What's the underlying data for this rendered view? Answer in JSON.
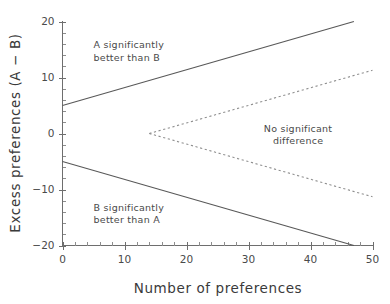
{
  "chart_data": {
    "type": "line",
    "title": "",
    "xlabel": "Number of preferences",
    "ylabel": "Excess preferences (A − B)",
    "xlim": [
      0,
      50
    ],
    "ylim": [
      -20,
      20
    ],
    "grid": false,
    "legend_position": "none",
    "x_ticks": [
      0,
      10,
      20,
      30,
      40,
      50
    ],
    "x_tick_labels": [
      "0",
      "10",
      "20",
      "30",
      "40",
      "50"
    ],
    "x_minor_tick_step": 2,
    "y_ticks": [
      20,
      10,
      0,
      -10,
      -20
    ],
    "y_tick_labels": [
      "20",
      "10",
      "0",
      "−10",
      "−20"
    ],
    "y_minor_tick_step": 2,
    "series": [
      {
        "name": "upper-significance-boundary",
        "style": "solid",
        "color": "#585858",
        "points": [
          [
            0,
            5
          ],
          [
            47,
            20
          ]
        ]
      },
      {
        "name": "lower-significance-boundary",
        "style": "solid",
        "color": "#585858",
        "points": [
          [
            0,
            -5
          ],
          [
            47,
            -20
          ]
        ]
      },
      {
        "name": "upper-dotted-boundary",
        "style": "dotted",
        "color": "#8f8f8f",
        "points": [
          [
            14,
            0
          ],
          [
            50,
            11.3
          ]
        ]
      },
      {
        "name": "lower-dotted-boundary",
        "style": "dotted",
        "color": "#8f8f8f",
        "points": [
          [
            14,
            0
          ],
          [
            50,
            -11.3
          ]
        ]
      }
    ],
    "annotations": [
      {
        "id": "region-a-better",
        "lines": [
          "A significantly",
          "better than B"
        ],
        "x": 5,
        "y": 15.2,
        "align": "left"
      },
      {
        "id": "region-no-difference",
        "lines": [
          "No significant",
          "difference"
        ],
        "x": 38,
        "y": 0.3,
        "align": "center"
      },
      {
        "id": "region-b-better",
        "lines": [
          "B significantly",
          "better than A"
        ],
        "x": 5,
        "y": -13.8,
        "align": "left"
      }
    ]
  },
  "figure": {
    "background_color": "#ffffff",
    "axis_color": "#6e6e6e",
    "solid_series_color": "#585858",
    "dotted_series_color": "#8f8f8f",
    "text_color": "#4a4a4a"
  }
}
